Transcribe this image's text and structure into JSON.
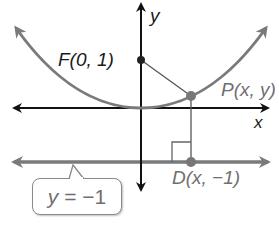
{
  "figure": {
    "type": "parabola-focus-directrix",
    "equation_directrix": "y = −1",
    "colors": {
      "axes": "#111111",
      "parabola": "#7a7a7a",
      "directrix": "#7a7a7a",
      "point_dark": "#222222",
      "point_gray": "#777777",
      "segments": "#555555",
      "label_gray": "#6f6f6f",
      "label_black": "#1a1a1a"
    }
  },
  "labels": {
    "y_axis": "y",
    "x_axis": "x",
    "focus": "F(0, 1)",
    "point_on_parabola": "P(x, y)",
    "point_on_directrix": "D(x, −1)",
    "directrix_callout_var": "y",
    "directrix_callout_rest": " = −1"
  },
  "points": {
    "focus": {
      "name": "F",
      "x": 0,
      "y": 1
    },
    "P": {
      "name": "P",
      "x": "x",
      "y": "y"
    },
    "D": {
      "name": "D",
      "x": "x",
      "y": -1
    }
  }
}
